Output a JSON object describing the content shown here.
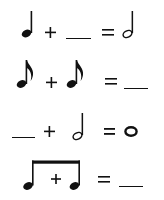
{
  "worksheet": {
    "topic": "note value addition",
    "colors": {
      "ink": "#111111",
      "background": "#ffffff"
    },
    "equations": [
      {
        "terms": [
          "quarter-note",
          "+",
          "blank",
          "=",
          "half-note"
        ],
        "answer_blank": true
      },
      {
        "terms": [
          "eighth-note",
          "+",
          "eighth-note",
          "=",
          "blank"
        ],
        "answer_blank": true
      },
      {
        "terms": [
          "blank",
          "+",
          "half-note",
          "=",
          "whole-note"
        ],
        "answer_blank": true
      },
      {
        "terms": [
          "beamed-eighth-pair-with-plus",
          "=",
          "blank"
        ],
        "answer_blank": true
      }
    ],
    "symbols": {
      "plus": "+",
      "equals": "=",
      "whole_note_glyph": "o"
    }
  }
}
